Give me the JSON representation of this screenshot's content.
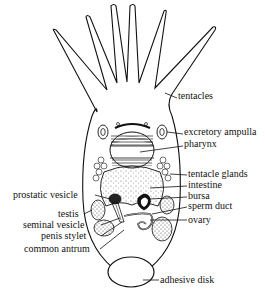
{
  "figure": {
    "colors": {
      "ink": "#111111",
      "background": "#ffffff",
      "stipple": "#555555"
    },
    "labels_right": [
      {
        "text": "tentacles",
        "x": 178,
        "y": 95
      },
      {
        "text": "excretory ampulla",
        "x": 184,
        "y": 131
      },
      {
        "text": "pharynx",
        "x": 184,
        "y": 143
      },
      {
        "text": "tentacle glands",
        "x": 188,
        "y": 172
      },
      {
        "text": "intestine",
        "x": 188,
        "y": 183
      },
      {
        "text": "bursa",
        "x": 188,
        "y": 194
      },
      {
        "text": "sperm duct",
        "x": 188,
        "y": 204
      },
      {
        "text": "ovary",
        "x": 188,
        "y": 217
      },
      {
        "text": "adhesive disk",
        "x": 160,
        "y": 277
      }
    ],
    "labels_left": [
      {
        "text": "prostatic vesicle",
        "x": 13,
        "y": 192
      },
      {
        "text": "testis",
        "x": 58,
        "y": 211
      },
      {
        "text": "seminal vesicle",
        "x": 23,
        "y": 222
      },
      {
        "text": "penis stylet",
        "x": 41,
        "y": 233
      },
      {
        "text": "common antrum",
        "x": 24,
        "y": 246
      }
    ]
  }
}
